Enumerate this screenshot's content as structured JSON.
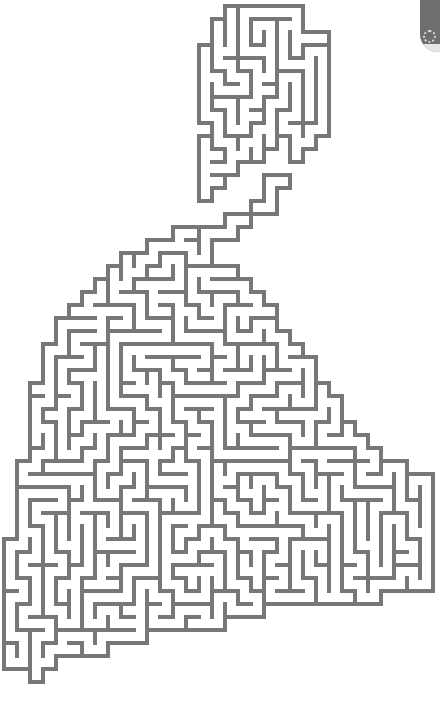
{
  "image": {
    "width": 440,
    "height": 703,
    "background": "#ffffff"
  },
  "maze": {
    "line_color": "#777777",
    "line_width": 4,
    "cell_size": 13,
    "seed": 7,
    "outline_polygon": [
      [
        206,
        14
      ],
      [
        262,
        10
      ],
      [
        297,
        12
      ],
      [
        302,
        24
      ],
      [
        319,
        28
      ],
      [
        326,
        40
      ],
      [
        330,
        55
      ],
      [
        330,
        93
      ],
      [
        329,
        112
      ],
      [
        313,
        118
      ],
      [
        306,
        126
      ],
      [
        293,
        128
      ],
      [
        292,
        175
      ],
      [
        282,
        180
      ],
      [
        270,
        180
      ],
      [
        258,
        206
      ],
      [
        248,
        216
      ],
      [
        222,
        218
      ],
      [
        210,
        229
      ],
      [
        180,
        232
      ],
      [
        163,
        238
      ],
      [
        131,
        252
      ],
      [
        114,
        266
      ],
      [
        100,
        276
      ],
      [
        88,
        290
      ],
      [
        75,
        300
      ],
      [
        64,
        315
      ],
      [
        60,
        330
      ],
      [
        50,
        344
      ],
      [
        40,
        360
      ],
      [
        36,
        380
      ],
      [
        36,
        400
      ],
      [
        25,
        425
      ],
      [
        24,
        455
      ],
      [
        22,
        470
      ],
      [
        22,
        500
      ],
      [
        20,
        520
      ],
      [
        10,
        545
      ],
      [
        6,
        570
      ],
      [
        4,
        590
      ],
      [
        6,
        620
      ],
      [
        8,
        660
      ],
      [
        12,
        670
      ],
      [
        28,
        676
      ],
      [
        30,
        690
      ],
      [
        36,
        686
      ],
      [
        40,
        668
      ],
      [
        60,
        660
      ],
      [
        90,
        662
      ],
      [
        110,
        648
      ],
      [
        135,
        640
      ],
      [
        175,
        630
      ],
      [
        215,
        626
      ],
      [
        250,
        614
      ],
      [
        290,
        606
      ],
      [
        330,
        600
      ],
      [
        370,
        598
      ],
      [
        410,
        594
      ],
      [
        436,
        592
      ],
      [
        436,
        475
      ],
      [
        430,
        470
      ],
      [
        404,
        468
      ],
      [
        385,
        460
      ],
      [
        370,
        445
      ],
      [
        355,
        425
      ],
      [
        340,
        405
      ],
      [
        330,
        395
      ],
      [
        322,
        380
      ],
      [
        310,
        360
      ],
      [
        295,
        345
      ],
      [
        282,
        325
      ],
      [
        270,
        305
      ],
      [
        262,
        290
      ],
      [
        250,
        280
      ],
      [
        240,
        268
      ],
      [
        214,
        258
      ],
      [
        214,
        248
      ],
      [
        226,
        244
      ],
      [
        234,
        236
      ],
      [
        240,
        228
      ],
      [
        255,
        222
      ],
      [
        270,
        210
      ],
      [
        274,
        196
      ],
      [
        284,
        188
      ],
      [
        290,
        182
      ],
      [
        290,
        176
      ],
      [
        300,
        160
      ],
      [
        316,
        152
      ],
      [
        316,
        138
      ],
      [
        326,
        128
      ],
      [
        330,
        114
      ],
      [
        316,
        118
      ],
      [
        306,
        124
      ],
      [
        294,
        126
      ],
      [
        292,
        128
      ],
      [
        275,
        140
      ],
      [
        262,
        150
      ],
      [
        256,
        160
      ],
      [
        244,
        168
      ],
      [
        232,
        176
      ],
      [
        220,
        188
      ],
      [
        212,
        198
      ],
      [
        204,
        206
      ],
      [
        204,
        176
      ],
      [
        200,
        160
      ],
      [
        200,
        145
      ],
      [
        210,
        137
      ],
      [
        206,
        130
      ],
      [
        204,
        120
      ],
      [
        204,
        92
      ],
      [
        200,
        80
      ],
      [
        200,
        60
      ],
      [
        206,
        50
      ],
      [
        206,
        30
      ]
    ]
  },
  "corner_badge": {
    "color": "#6e6e6e",
    "glyph": "flower-icon"
  }
}
